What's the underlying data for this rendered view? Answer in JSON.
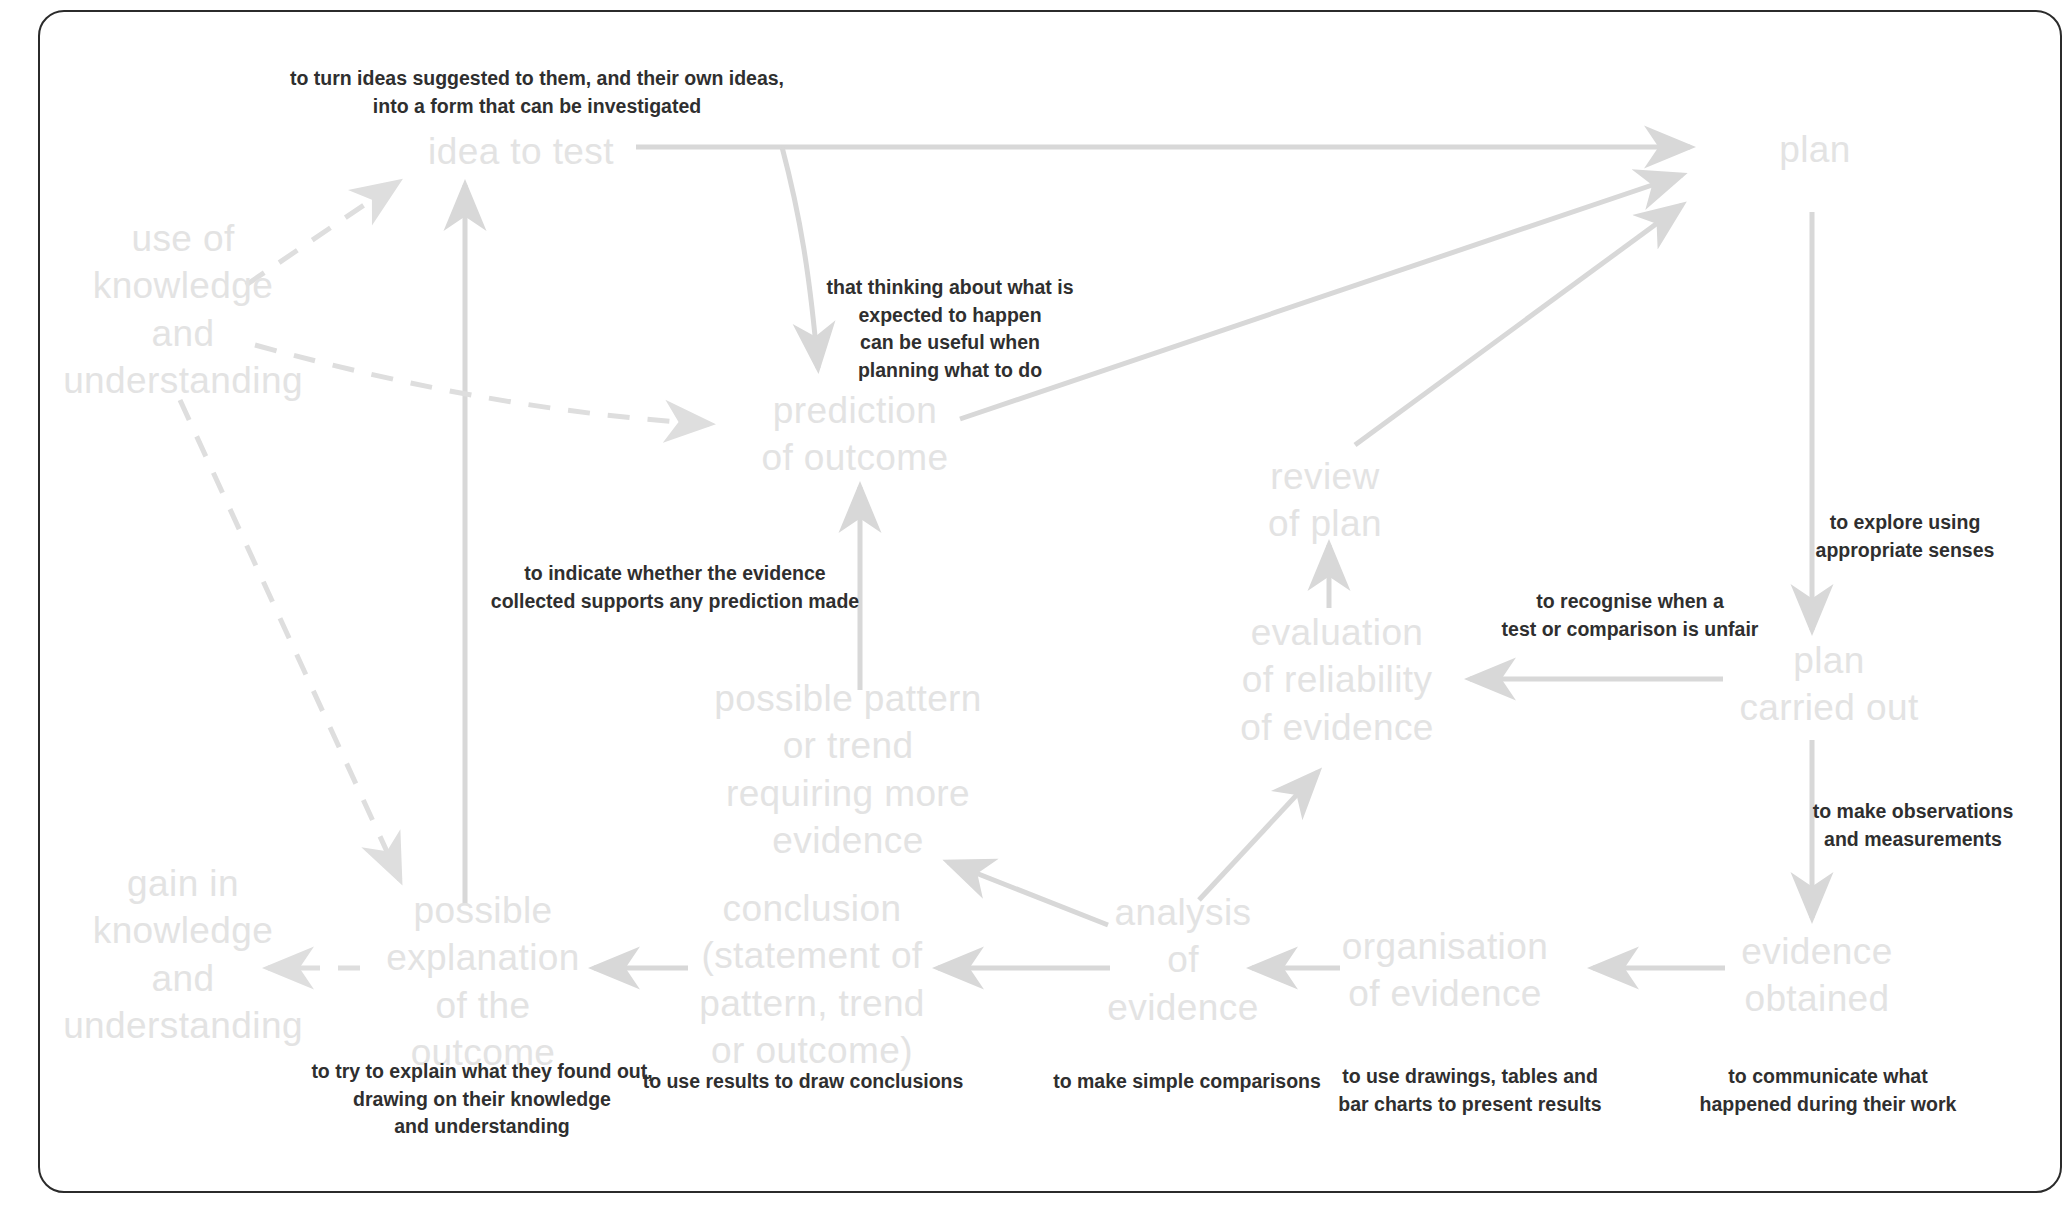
{
  "diagram": {
    "palette": {
      "node_text": "#e3e3e3",
      "annotation_text": "#2f2f2f",
      "edge": "#d8d8d8",
      "border": "#2b2b2b",
      "background": "#ffffff"
    },
    "nodes": [
      {
        "id": "idea-to-test",
        "label": "idea to test",
        "x": 521,
        "y": 152
      },
      {
        "id": "plan",
        "label": "plan",
        "x": 1815,
        "y": 150
      },
      {
        "id": "use-of-knowledge",
        "label": "use of\nknowledge\nand\nunderstanding",
        "x": 183,
        "y": 310
      },
      {
        "id": "prediction-of-outcome",
        "label": "prediction\nof outcome",
        "x": 855,
        "y": 434
      },
      {
        "id": "review-of-plan",
        "label": "review\nof plan",
        "x": 1325,
        "y": 500
      },
      {
        "id": "evaluation-of-reliability",
        "label": "evaluation\nof reliability\nof evidence",
        "x": 1337,
        "y": 680
      },
      {
        "id": "plan-carried-out",
        "label": "plan\ncarried out",
        "x": 1829,
        "y": 684
      },
      {
        "id": "possible-pattern",
        "label": "possible pattern\nor trend\nrequiring more\nevidence",
        "x": 848,
        "y": 770
      },
      {
        "id": "gain-in-knowledge",
        "label": "gain in\nknowledge\nand\nunderstanding",
        "x": 183,
        "y": 955
      },
      {
        "id": "possible-explanation",
        "label": "possible\nexplanation\nof the\noutcome",
        "x": 483,
        "y": 982
      },
      {
        "id": "conclusion",
        "label": "conclusion\n(statement of\npattern, trend\nor outcome)",
        "x": 812,
        "y": 980
      },
      {
        "id": "analysis-of-evidence",
        "label": "analysis\nof\nevidence",
        "x": 1183,
        "y": 960
      },
      {
        "id": "organisation-of-evidence",
        "label": "organisation\nof evidence",
        "x": 1445,
        "y": 970
      },
      {
        "id": "evidence-obtained",
        "label": "evidence\nobtained",
        "x": 1817,
        "y": 975
      }
    ],
    "annotations": [
      {
        "id": "ann-idea",
        "text": "to turn ideas suggested to them, and their own ideas,\ninto a form that can be investigated",
        "x": 537,
        "y": 93
      },
      {
        "id": "ann-prediction",
        "text": "that thinking about what is\nexpected to happen\ncan be useful when\nplanning what to do",
        "x": 950,
        "y": 329
      },
      {
        "id": "ann-explore",
        "text": "to explore using\nappropriate senses",
        "x": 1905,
        "y": 537
      },
      {
        "id": "ann-unfair",
        "text": "to recognise when a\ntest or comparison is unfair",
        "x": 1630,
        "y": 616
      },
      {
        "id": "ann-evidence-pred",
        "text": "to indicate whether the evidence\ncollected supports any prediction made",
        "x": 675,
        "y": 588
      },
      {
        "id": "ann-observations",
        "text": "to make observations\nand measurements",
        "x": 1913,
        "y": 826
      },
      {
        "id": "ann-explain",
        "text": "to try to explain what they found out,\ndrawing on their knowledge\nand understanding",
        "x": 482,
        "y": 1100
      },
      {
        "id": "ann-conclusions",
        "text": "to use results to draw conclusions",
        "x": 803,
        "y": 1082
      },
      {
        "id": "ann-comparisons",
        "text": "to make simple comparisons",
        "x": 1187,
        "y": 1082
      },
      {
        "id": "ann-drawings",
        "text": "to use drawings, tables and\nbar charts to present results",
        "x": 1470,
        "y": 1091
      },
      {
        "id": "ann-communicate",
        "text": "to communicate what\nhappened during their work",
        "x": 1828,
        "y": 1091
      }
    ],
    "edges": [
      {
        "id": "e-idea-to-plan",
        "from": "idea to test",
        "to": "plan",
        "style": "solid"
      },
      {
        "id": "e-idea-to-prediction",
        "from": "idea to test",
        "to": "prediction of outcome",
        "style": "solid"
      },
      {
        "id": "e-prediction-to-plan",
        "from": "prediction of outcome",
        "to": "plan",
        "style": "solid"
      },
      {
        "id": "e-review-to-plan",
        "from": "review of plan",
        "to": "plan",
        "style": "solid"
      },
      {
        "id": "e-plan-to-carried-out",
        "from": "plan",
        "to": "plan carried out",
        "style": "solid"
      },
      {
        "id": "e-carried-out-to-evaluation",
        "from": "plan carried out",
        "to": "evaluation of reliability of evidence",
        "style": "solid"
      },
      {
        "id": "e-evaluation-to-review",
        "from": "evaluation of reliability of evidence",
        "to": "review of plan",
        "style": "solid"
      },
      {
        "id": "e-carried-out-to-evidence",
        "from": "plan carried out",
        "to": "evidence obtained",
        "style": "solid"
      },
      {
        "id": "e-evidence-to-organisation",
        "from": "evidence obtained",
        "to": "organisation of evidence",
        "style": "solid"
      },
      {
        "id": "e-organisation-to-analysis",
        "from": "organisation of evidence",
        "to": "analysis of evidence",
        "style": "solid"
      },
      {
        "id": "e-analysis-to-evaluation",
        "from": "analysis of evidence",
        "to": "evaluation of reliability of evidence",
        "style": "solid"
      },
      {
        "id": "e-analysis-to-conclusion",
        "from": "analysis of evidence",
        "to": "conclusion",
        "style": "solid"
      },
      {
        "id": "e-analysis-to-pattern",
        "from": "analysis of evidence",
        "to": "possible pattern or trend requiring more evidence",
        "style": "solid"
      },
      {
        "id": "e-conclusion-to-explanation",
        "from": "conclusion",
        "to": "possible explanation of the outcome",
        "style": "solid"
      },
      {
        "id": "e-pattern-to-prediction",
        "from": "possible pattern or trend requiring more evidence",
        "to": "prediction of outcome",
        "style": "solid"
      },
      {
        "id": "e-explanation-to-idea",
        "from": "possible explanation of the outcome",
        "to": "idea to test",
        "style": "solid"
      },
      {
        "id": "e-explanation-to-gain",
        "from": "possible explanation of the outcome",
        "to": "gain in knowledge and understanding",
        "style": "dashed"
      },
      {
        "id": "e-knowledge-to-idea",
        "from": "use of knowledge and understanding",
        "to": "idea to test",
        "style": "dashed"
      },
      {
        "id": "e-knowledge-to-prediction",
        "from": "use of knowledge and understanding",
        "to": "prediction of outcome",
        "style": "dashed"
      },
      {
        "id": "e-knowledge-to-explanation",
        "from": "use of knowledge and understanding",
        "to": "possible explanation of the outcome",
        "style": "dashed"
      }
    ]
  }
}
